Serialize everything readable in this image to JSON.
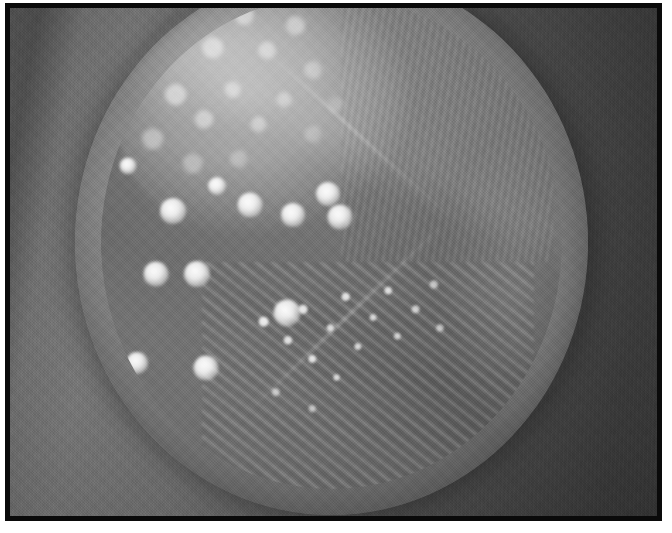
{
  "figure": {
    "kind": "photograph",
    "color_mode": "grayscale",
    "caption": "",
    "frame": {
      "border_color": "#0a0a0a",
      "border_width_px": 5,
      "page_background": "#ffffff"
    }
  },
  "scene": {
    "backdrop": {
      "description": "smooth neutral gray studio backdrop, brighter at left, falling off to near-black at right",
      "left_tone": "#757575",
      "right_tone": "#3a3a3a"
    },
    "dish": {
      "label": "petri-dish",
      "shape": "circle",
      "cropped_at_top": true,
      "glass_rim_highlight": "#ffffff",
      "agar_tone": "#7b7b7b",
      "rim_tone": "#9a9a9a"
    },
    "growth": {
      "confluent_region": {
        "label": "confluent-growth",
        "position": "upper-left quadrant",
        "tone": "#cfcfcf"
      },
      "swab_zone": {
        "label": "chevron-swab-zone",
        "description": "darker V-shaped chevron band separating the colony field from the streak field",
        "tone": "#5f5f5f"
      },
      "streak_fields": [
        {
          "label": "streak-field-right",
          "position": "upper-right",
          "direction": "near-vertical fine parallel streaks"
        },
        {
          "label": "streak-field-bottom",
          "position": "lower-right",
          "direction": "diagonal parallel streaks with discrete colonies along the lines"
        }
      ],
      "discrete_colonies": [
        {
          "id": "colony-1",
          "x": 163,
          "y": 203,
          "d": 26
        },
        {
          "id": "colony-2",
          "x": 240,
          "y": 197,
          "d": 25
        },
        {
          "id": "colony-3",
          "x": 283,
          "y": 207,
          "d": 24
        },
        {
          "id": "colony-4",
          "x": 318,
          "y": 186,
          "d": 24
        },
        {
          "id": "colony-5",
          "x": 330,
          "y": 209,
          "d": 25
        },
        {
          "id": "colony-6",
          "x": 207,
          "y": 178,
          "d": 18
        },
        {
          "id": "colony-7",
          "x": 146,
          "y": 266,
          "d": 25
        },
        {
          "id": "colony-8",
          "x": 187,
          "y": 266,
          "d": 26
        },
        {
          "id": "colony-9",
          "x": 277,
          "y": 305,
          "d": 27
        },
        {
          "id": "colony-10",
          "x": 127,
          "y": 355,
          "d": 22
        },
        {
          "id": "colony-11",
          "x": 196,
          "y": 360,
          "d": 25
        },
        {
          "id": "colony-12",
          "x": 118,
          "y": 158,
          "d": 17
        }
      ],
      "discrete_colony_count": 12
    }
  }
}
